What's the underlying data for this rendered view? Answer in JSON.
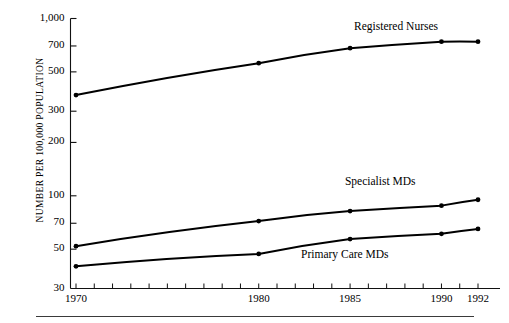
{
  "chart_data": {
    "type": "line",
    "title": "",
    "subtitle": "",
    "xlabel": "",
    "ylabel": "NUMBER PER 100,000 POPULATION",
    "yscale": "log",
    "ylim": [
      30,
      1000
    ],
    "xlim": [
      1970,
      1992
    ],
    "grid": false,
    "legend_position": "inline-right-of-series",
    "y_ticks": [
      {
        "value": 1000,
        "label": "1,000"
      },
      {
        "value": 700,
        "label": "700"
      },
      {
        "value": 500,
        "label": "500"
      },
      {
        "value": 300,
        "label": "300"
      },
      {
        "value": 200,
        "label": "200"
      },
      {
        "value": 100,
        "label": "100"
      },
      {
        "value": 70,
        "label": "70"
      },
      {
        "value": 50,
        "label": "50"
      },
      {
        "value": 30,
        "label": "30"
      }
    ],
    "x_ticks_all": [
      1970,
      1971,
      1972,
      1973,
      1974,
      1975,
      1976,
      1977,
      1978,
      1979,
      1980,
      1981,
      1982,
      1983,
      1984,
      1985,
      1986,
      1987,
      1988,
      1989,
      1990,
      1991,
      1992
    ],
    "x_tick_labels": [
      {
        "value": 1970,
        "label": "1970"
      },
      {
        "value": 1980,
        "label": "1980"
      },
      {
        "value": 1985,
        "label": "1985"
      },
      {
        "value": 1990,
        "label": "1990"
      },
      {
        "value": 1992,
        "label": "1992"
      }
    ],
    "x": [
      1970,
      1980,
      1985,
      1990,
      1992
    ],
    "series": [
      {
        "name": "Registered Nurses",
        "label": "Registered Nurses",
        "color": "#000000",
        "values": [
          370,
          560,
          680,
          740,
          740
        ]
      },
      {
        "name": "Specialist MDs",
        "label": "Specialist MDs",
        "color": "#000000",
        "values": [
          52,
          72,
          82,
          88,
          95
        ]
      },
      {
        "name": "Primary Care MDs",
        "label": "Primary Care MDs",
        "color": "#000000",
        "values": [
          40,
          47,
          57,
          61,
          65
        ]
      }
    ],
    "annotations": [
      {
        "text": "Registered Nurses",
        "x": 1988.5,
        "y": 880
      },
      {
        "text": "Specialist MDs",
        "x": 1988.0,
        "y": 118
      },
      {
        "text": "Primary Care MDs",
        "x": 1985.6,
        "y": 46
      }
    ]
  },
  "footer_rule": {
    "present": true
  }
}
